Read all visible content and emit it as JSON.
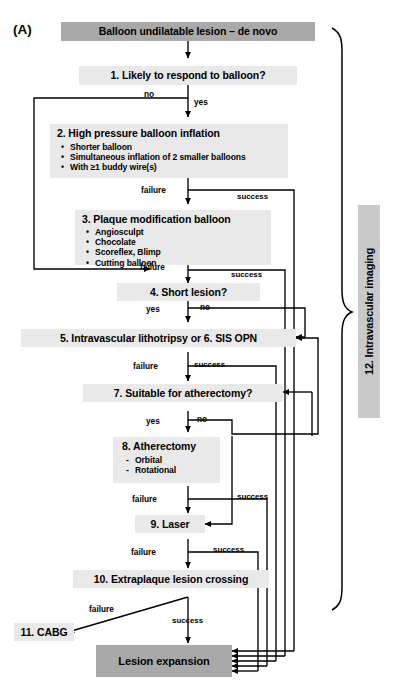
{
  "figure": {
    "panel_tag": "(A)",
    "colors": {
      "box_fill": "#e9e9e9",
      "start_end_fill": "#a9a9a9",
      "panel_label_fill": "#c9c9c9",
      "line": "#000000",
      "background": "#ffffff"
    }
  },
  "nodes": {
    "start": {
      "label": "Balloon undilatable lesion – de novo"
    },
    "step1": {
      "label": "1. Likely to respond to balloon?"
    },
    "step2": {
      "label": "2. High pressure balloon inflation",
      "bullets": [
        "Shorter balloon",
        "Simultaneous inflation of 2 smaller balloons",
        "With ≥1 buddy wire(s)"
      ],
      "bullet_glyph": "•"
    },
    "step3": {
      "label": "3. Plaque modification balloon",
      "bullets": [
        "Angiosculpt",
        "Chocolate",
        "Scoreflex, Blimp",
        "Cutting balloon"
      ],
      "bullet_glyph": "•"
    },
    "step4": {
      "label": "4. Short lesion?"
    },
    "step5": {
      "label": "5. Intravascular lithotripsy or 6. SIS OPN"
    },
    "step7": {
      "label": "7. Suitable for atherectomy?"
    },
    "step8": {
      "label": "8. Atherectomy",
      "bullets": [
        "Orbital",
        "Rotational"
      ],
      "bullet_glyph": "-"
    },
    "step9": {
      "label": "9. Laser"
    },
    "step10": {
      "label": "10. Extraplaque lesion crossing"
    },
    "step11": {
      "label": "11. CABG"
    },
    "step12": {
      "label": "12. Intravascular imaging"
    },
    "end": {
      "label": "Lesion expansion"
    }
  },
  "edge_labels": {
    "s1_no": "no",
    "s1_yes": "yes",
    "s2_failure": "failure",
    "s2_success": "success",
    "s3_failure": "failure",
    "s3_success": "success",
    "s4_yes": "yes",
    "s4_no": "no",
    "s5_failure": "failure",
    "s5_success": "success",
    "s7_yes": "yes",
    "s7_no": "no",
    "s8_failure": "failure",
    "s8_success": "success",
    "s9_failure": "failure",
    "s9_success": "success",
    "s10_failure": "failure",
    "s10_success": "success"
  }
}
